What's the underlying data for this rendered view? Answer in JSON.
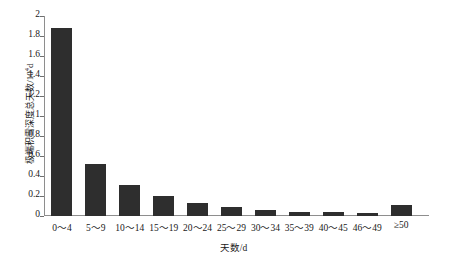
{
  "chart_data": {
    "type": "bar",
    "title": "",
    "subtitle": "",
    "xlabel": "天数/d",
    "ylabel_text": "极端积雪深度总天数/10",
    "ylabel_exponent": "4",
    "ylabel_unit_suffix": "d",
    "ylabel_full": "极端积雪深度总天数/10⁴d",
    "categories": [
      "0～4",
      "5～9",
      "10～14",
      "15～19",
      "20～24",
      "25～29",
      "30～34",
      "35～39",
      "40～45",
      "46～49",
      "≥50"
    ],
    "values": [
      1.88,
      0.52,
      0.31,
      0.2,
      0.13,
      0.09,
      0.065,
      0.045,
      0.045,
      0.03,
      0.11
    ],
    "ylim": [
      0,
      2
    ],
    "xlim_categories": 11,
    "ytick_values": [
      0,
      0.2,
      0.4,
      0.6,
      0.8,
      1,
      1.2,
      1.4,
      1.6,
      1.8,
      2
    ],
    "ytick_labels": [
      "0",
      "0.2",
      "0.4",
      "0.6",
      "0.8",
      "1",
      "1.2",
      "1.4",
      "1.6",
      "1.8",
      "2"
    ],
    "grid": false,
    "legend": null,
    "legend_position": "none",
    "bar_color": "#2e2e2e",
    "axis_color": "#8e8e8e",
    "background_color": "#ffffff",
    "bar_width_ratio": 0.62
  }
}
